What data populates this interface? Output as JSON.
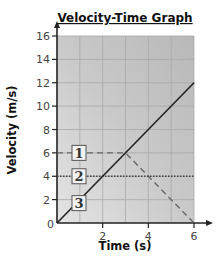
{
  "chart_data": {
    "type": "line",
    "title": "Velocity-Time Graph",
    "xlabel": "Time (s)",
    "ylabel": "Velocity (m/s)",
    "xlim": [
      0,
      6
    ],
    "ylim": [
      0,
      16
    ],
    "x_ticks": [
      0,
      2,
      4,
      6
    ],
    "y_ticks": [
      0,
      2,
      4,
      6,
      8,
      10,
      12,
      14,
      16
    ],
    "x_tick_labels": [
      "2",
      "4",
      "6"
    ],
    "y_tick_labels": [
      "0",
      "2",
      "4",
      "6",
      "8",
      "10",
      "12",
      "14",
      "16"
    ],
    "grid": true,
    "legend": "none",
    "series": [
      {
        "name": "1",
        "style": "dashed",
        "x": [
          0,
          3,
          6
        ],
        "y": [
          6,
          6,
          0
        ]
      },
      {
        "name": "2",
        "style": "dotted",
        "x": [
          0,
          6
        ],
        "y": [
          4,
          4
        ]
      },
      {
        "name": "3",
        "style": "solid",
        "x": [
          0,
          6
        ],
        "y": [
          0,
          12
        ]
      }
    ],
    "annotations": [
      "1",
      "2",
      "3"
    ]
  }
}
